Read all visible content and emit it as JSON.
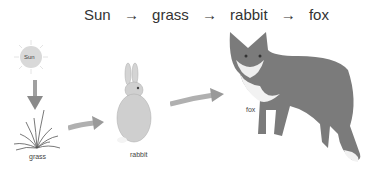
{
  "chain": {
    "items": [
      "Sun",
      "grass",
      "rabbit",
      "fox"
    ],
    "arrow": "→"
  },
  "labels": {
    "sun": "Sun",
    "grass": "grass",
    "rabbit": "rabbit",
    "fox": "fox"
  },
  "colors": {
    "sun": "#d9d9d9",
    "arrow": "#8a8a8a",
    "rabbit": "#cfcfcf",
    "fox": "#7a7a7a"
  }
}
